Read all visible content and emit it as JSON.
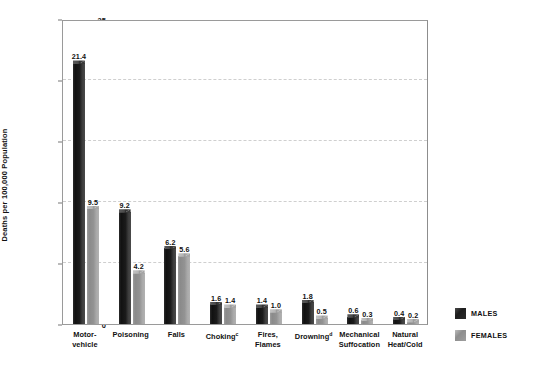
{
  "chart_data": {
    "type": "bar",
    "title": "",
    "xlabel": "",
    "ylabel": "Deaths per 100,000 Population",
    "ylim": [
      0,
      25
    ],
    "yticks": [
      0,
      5,
      10,
      15,
      20,
      25
    ],
    "grid": true,
    "legend_position": "right",
    "categories": [
      "Motor-\nvehicle",
      "Poisoning",
      "Falls",
      "Choking",
      "Fires,\nFlames",
      "Drowning",
      "Mechanical\nSuffocation",
      "Natural\nHeat/Cold"
    ],
    "category_footnotes": [
      "",
      "",
      "",
      "c",
      "",
      "d",
      "",
      ""
    ],
    "series": [
      {
        "name": "MALES",
        "color": "#1d1d1d",
        "values": [
          21.4,
          9.2,
          6.2,
          1.6,
          1.4,
          1.8,
          0.6,
          0.4
        ]
      },
      {
        "name": "FEMALES",
        "color": "#9a9a9a",
        "values": [
          9.5,
          4.2,
          5.6,
          1.4,
          1.0,
          0.5,
          0.3,
          0.2
        ]
      }
    ]
  },
  "legend": {
    "items": [
      {
        "label": "MALES"
      },
      {
        "label": "FEMALES"
      }
    ]
  }
}
